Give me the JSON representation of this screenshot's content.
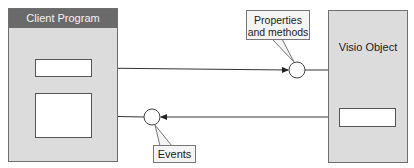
{
  "diagram": {
    "client": {
      "title": "Client Program",
      "header_color": "#6a6a6a",
      "panel_color": "#dcdcdc"
    },
    "visio": {
      "title": "Visio Object",
      "panel_color": "#dcdcdc"
    },
    "callouts": {
      "properties": "Properties and methods",
      "events": "Events"
    },
    "connections": [
      {
        "from": "client-slot-top",
        "to": "properties-interface",
        "direction": "right"
      },
      {
        "from": "properties-interface",
        "to": "visio-object",
        "direction": "none"
      },
      {
        "from": "visio-slot",
        "to": "events-interface",
        "direction": "left"
      },
      {
        "from": "events-interface",
        "to": "client-slot-bottom",
        "direction": "none"
      }
    ]
  }
}
